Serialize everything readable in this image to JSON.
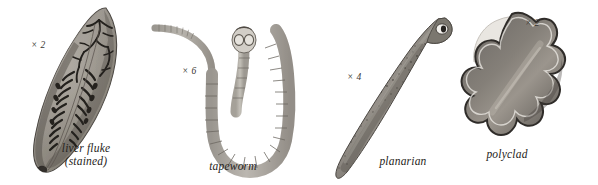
{
  "plate": {
    "background_color": "#ffffff",
    "ink_color": "#262320",
    "specimens": [
      {
        "id": "liver-fluke",
        "caption": "liver fluke\n(stained)",
        "magnification": "× 2",
        "common_name": "liver fluke",
        "preparation": "stained",
        "body_tone": "#8d8983",
        "detail_tone": "#2b2724"
      },
      {
        "id": "tapeworm",
        "caption": "tapeworm",
        "magnification": "× 6",
        "common_name": "tapeworm",
        "preparation": "",
        "body_tone": "#b9b5ae",
        "detail_tone": "#8a857e"
      },
      {
        "id": "planarian",
        "caption": "planarian",
        "magnification": "× 4",
        "common_name": "planarian",
        "preparation": "",
        "body_tone": "#8f8b85",
        "detail_tone": "#3a3733"
      },
      {
        "id": "polyclad",
        "caption": "polyclad",
        "magnification": "× 2",
        "common_name": "polyclad",
        "preparation": "",
        "body_tone": "#7e7a75",
        "detail_tone": "#2e2b28"
      }
    ]
  }
}
